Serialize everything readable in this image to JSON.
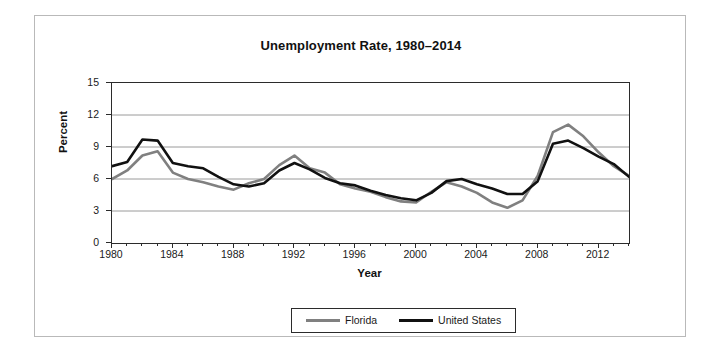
{
  "chart_data": {
    "type": "line",
    "title": "Unemployment Rate, 1980–2014",
    "xlabel": "Year",
    "ylabel": "Percent",
    "xlim": [
      1980,
      2014
    ],
    "ylim": [
      0,
      15
    ],
    "ytick_values": [
      0,
      3,
      6,
      9,
      12,
      15
    ],
    "ytick_labels": [
      "0",
      "3",
      "6",
      "9",
      "12",
      "15"
    ],
    "xtick_values": [
      1980,
      1984,
      1988,
      1992,
      1996,
      2000,
      2004,
      2008,
      2012
    ],
    "xtick_labels": [
      "1980",
      "1984",
      "1988",
      "1992",
      "1996",
      "2000",
      "2004",
      "2008",
      "2012"
    ],
    "x": [
      1980,
      1981,
      1982,
      1983,
      1984,
      1985,
      1986,
      1987,
      1988,
      1989,
      1990,
      1991,
      1992,
      1993,
      1994,
      1995,
      1996,
      1997,
      1998,
      1999,
      2000,
      2001,
      2002,
      2003,
      2004,
      2005,
      2006,
      2007,
      2008,
      2009,
      2010,
      2011,
      2012,
      2013,
      2014
    ],
    "grid": true,
    "grid_axis": "y",
    "legend_position": "bottom-center",
    "series": [
      {
        "name": "Florida",
        "color": "#808080",
        "values": [
          6.0,
          6.8,
          8.2,
          8.6,
          6.6,
          6.0,
          5.7,
          5.3,
          5.0,
          5.6,
          6.0,
          7.3,
          8.2,
          7.0,
          6.6,
          5.5,
          5.1,
          4.8,
          4.3,
          3.9,
          3.8,
          4.8,
          5.7,
          5.3,
          4.7,
          3.8,
          3.3,
          4.0,
          6.3,
          10.4,
          11.1,
          10.0,
          8.5,
          7.2,
          6.3
        ]
      },
      {
        "name": "United States",
        "color": "#111111",
        "values": [
          7.2,
          7.6,
          9.7,
          9.6,
          7.5,
          7.2,
          7.0,
          6.2,
          5.5,
          5.3,
          5.6,
          6.8,
          7.5,
          6.9,
          6.1,
          5.6,
          5.4,
          4.9,
          4.5,
          4.2,
          4.0,
          4.7,
          5.8,
          6.0,
          5.5,
          5.1,
          4.6,
          4.6,
          5.8,
          9.3,
          9.6,
          8.9,
          8.1,
          7.4,
          6.2
        ]
      }
    ],
    "series_note_peaks": {
      "florida_peak": {
        "year": 2010,
        "value": 11.1
      },
      "united_states_peak": {
        "year": 1982,
        "value": 9.7
      }
    }
  },
  "legend": {
    "entries": [
      {
        "label": "Florida",
        "color": "#808080"
      },
      {
        "label": "United States",
        "color": "#111111"
      }
    ]
  }
}
